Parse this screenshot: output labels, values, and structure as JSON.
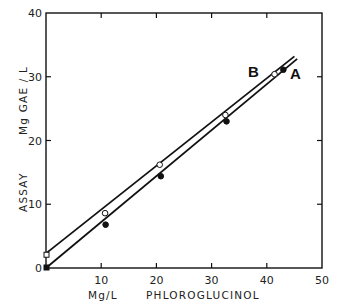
{
  "chart_data": {
    "type": "scatter",
    "title": "",
    "xlabel": "Mg/L   PHLOROGLUCINOL",
    "ylabel": "ASSAY   Mg GAE / L",
    "xlim": [
      0,
      50
    ],
    "ylim": [
      0,
      40
    ],
    "x_ticks": [
      0,
      10,
      20,
      30,
      40,
      50
    ],
    "x_tick_labels": [
      "",
      "10",
      "20",
      "30",
      "40",
      "50"
    ],
    "y_ticks": [
      0,
      10,
      20,
      30,
      40
    ],
    "y_tick_labels": [
      "0",
      "10",
      "20",
      "30",
      "40"
    ],
    "grid": false,
    "legend": "inline labels near line ends (B left, A right)",
    "series": [
      {
        "name": "B",
        "marker": "open circle (open square at x=0)",
        "x": [
          0,
          10.7,
          20.6,
          32.5,
          41.4
        ],
        "y": [
          2.0,
          8.6,
          16.2,
          24.0,
          30.4
        ],
        "fit_line": {
          "x": [
            0,
            45
          ],
          "y": [
            2.3,
            33.2
          ]
        }
      },
      {
        "name": "A",
        "marker": "filled circle (filled square at x=0)",
        "x": [
          0,
          10.8,
          20.8,
          32.7,
          43.0
        ],
        "y": [
          0,
          6.8,
          14.4,
          23.0,
          31.1
        ],
        "fit_line": {
          "x": [
            0,
            45.5
          ],
          "y": [
            0,
            32.8
          ]
        }
      }
    ]
  },
  "labels": {
    "series_b": "B",
    "series_a": "A",
    "x_unit": "Mg/L",
    "x_name": "PHLOROGLUCINOL",
    "y_name": "ASSAY",
    "y_unit": "Mg GAE / L"
  },
  "colors": {
    "ink": "#111111",
    "background": "#ffffff"
  }
}
